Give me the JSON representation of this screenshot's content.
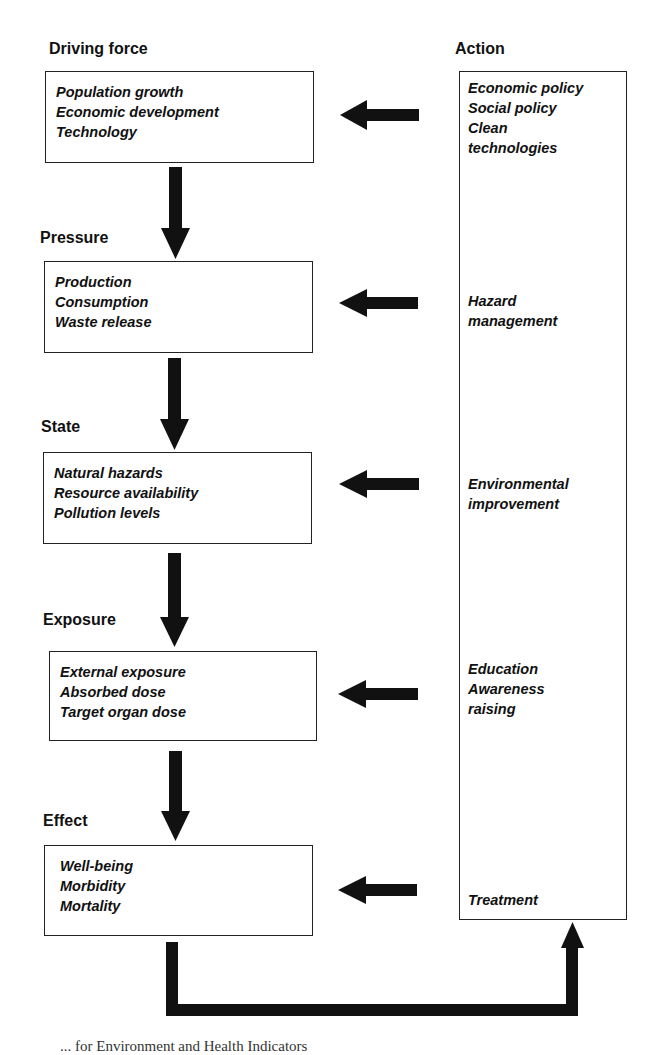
{
  "diagram": {
    "colors": {
      "stroke": "#222222",
      "arrow": "#111111",
      "background": "#ffffff"
    },
    "stages": [
      {
        "label": "Driving force",
        "items": [
          "Population growth",
          "Economic development",
          "Technology"
        ]
      },
      {
        "label": "Pressure",
        "items": [
          "Production",
          "Consumption",
          "Waste release"
        ]
      },
      {
        "label": "State",
        "items": [
          "Natural hazards",
          "Resource availability",
          "Pollution levels"
        ]
      },
      {
        "label": "Exposure",
        "items": [
          "External exposure",
          "Absorbed dose",
          "Target organ dose"
        ]
      },
      {
        "label": "Effect",
        "items": [
          "Well-being",
          "Morbidity",
          "Mortality"
        ]
      }
    ],
    "action": {
      "label": "Action",
      "groups": [
        {
          "items": [
            "Economic policy",
            "Social policy",
            "Clean",
            "technologies"
          ]
        },
        {
          "items": [
            "Hazard",
            "management"
          ]
        },
        {
          "items": [
            "Environmental",
            "improvement"
          ]
        },
        {
          "items": [
            "Education",
            "Awareness",
            "raising"
          ]
        },
        {
          "items": [
            "Treatment"
          ]
        }
      ]
    },
    "caption": "... for Environment and Health Indicators"
  }
}
